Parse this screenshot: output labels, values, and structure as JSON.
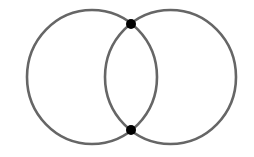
{
  "diagram": {
    "type": "two-intersecting-circles",
    "background": "#ffffff",
    "stroke_color": "#666666",
    "point_color": "#000000",
    "circles": [
      {
        "name": "left-circle",
        "cx": 92,
        "cy": 77,
        "rx": 65,
        "ry": 67
      },
      {
        "name": "right-circle",
        "cx": 170.5,
        "cy": 77,
        "rx": 65.5,
        "ry": 67
      }
    ],
    "points": [
      {
        "name": "top-intersection-point",
        "cx": 131,
        "cy": 24,
        "r": 5
      },
      {
        "name": "bottom-intersection-point",
        "cx": 131,
        "cy": 130,
        "r": 5
      }
    ]
  }
}
